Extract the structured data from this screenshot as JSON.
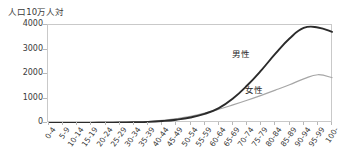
{
  "axis": {
    "y_title": "人口10万人対",
    "y_ticks": [
      "4000",
      "3000",
      "2000",
      "1000",
      "0"
    ]
  },
  "annotations": {
    "male_label": "男性",
    "female_label": "女性"
  },
  "colors": {
    "male_line": "#2b2b2b",
    "female_line": "#a6a6a6",
    "frame": "#c9c9c9",
    "tick": "#b8b8b8",
    "text": "#3a3a3a",
    "background": "#ffffff"
  },
  "chart_data": {
    "type": "line",
    "title": "",
    "xlabel": "",
    "ylabel": "人口10万人対",
    "ylim": [
      0,
      4000
    ],
    "yticks": [
      0,
      1000,
      2000,
      3000,
      4000
    ],
    "grid": false,
    "legend": "inline-annotation",
    "categories": [
      "0-4",
      "5-9",
      "10-14",
      "15-19",
      "20-24",
      "25-29",
      "30-34",
      "35-39",
      "40-44",
      "45-49",
      "50-54",
      "55-59",
      "60-64",
      "65-69",
      "70-74",
      "75-79",
      "80-84",
      "85-89",
      "90-94",
      "95-99",
      "100-"
    ],
    "series": [
      {
        "name": "男性",
        "color": "#2b2b2b",
        "values": [
          5,
          3,
          3,
          6,
          12,
          18,
          28,
          45,
          80,
          135,
          225,
          375,
          610,
          1000,
          1530,
          2150,
          2830,
          3450,
          3880,
          3900,
          3720
        ]
      },
      {
        "name": "女性",
        "color": "#a6a6a6",
        "values": [
          4,
          3,
          3,
          6,
          12,
          20,
          35,
          60,
          105,
          175,
          270,
          400,
          560,
          740,
          930,
          1130,
          1340,
          1560,
          1800,
          1970,
          1850
        ]
      }
    ]
  }
}
